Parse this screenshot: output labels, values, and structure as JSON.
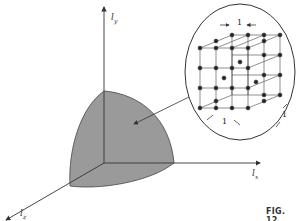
{
  "diagram": {
    "axes": {
      "y": {
        "symbol": "l",
        "subscript": "y"
      },
      "x": {
        "symbol": "l",
        "subscript": "x"
      },
      "z": {
        "symbol": "l",
        "subscript": "z"
      }
    },
    "inset": {
      "description": "cubic lattice of points in magnified circle",
      "spacing_labels": [
        "1",
        "1",
        "1"
      ]
    },
    "figure_label": "FIG. 12",
    "colors": {
      "region_fill": "#9a9a9a",
      "line": "#333333",
      "dot": "#222222"
    }
  }
}
